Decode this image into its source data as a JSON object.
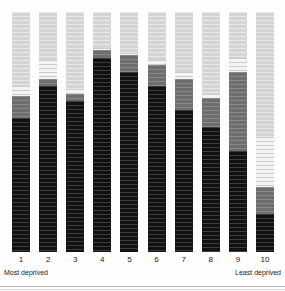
{
  "chart_data": {
    "type": "bar",
    "title": "",
    "subtitle": "",
    "xlabel": "",
    "ylabel": "",
    "stacked": true,
    "stack_mode": "percent",
    "grid": false,
    "legend_position": "none",
    "ylim": [
      0,
      100
    ],
    "categories": [
      "1",
      "2",
      "3",
      "4",
      "5",
      "6",
      "7",
      "8",
      "9",
      "10"
    ],
    "axis_annotations": {
      "left": "Most deprived",
      "right": "Least deprived"
    },
    "series": [
      {
        "name": "dark",
        "color": "#111111",
        "values": [
          56,
          69,
          63,
          81,
          75,
          69,
          59,
          52,
          42,
          16
        ]
      },
      {
        "name": "mid-gray",
        "color": "#6e6e6e",
        "values": [
          9,
          3,
          3,
          3,
          7,
          9,
          13,
          12,
          33,
          11
        ]
      },
      {
        "name": "white",
        "color": "#f4f4f4",
        "values": [
          4,
          8,
          2,
          1,
          1,
          2,
          3,
          2,
          6,
          21
        ]
      },
      {
        "name": "light-gray",
        "color": "#d4d4d4",
        "values": [
          31,
          20,
          32,
          15,
          17,
          20,
          25,
          34,
          19,
          52
        ]
      }
    ]
  },
  "bars": [
    {
      "label": "1",
      "dark": 56,
      "mid": 9,
      "white": 4,
      "light": 31
    },
    {
      "label": "2",
      "dark": 69,
      "mid": 3,
      "white": 8,
      "light": 20
    },
    {
      "label": "3",
      "dark": 63,
      "mid": 3,
      "white": 2,
      "light": 32
    },
    {
      "label": "4",
      "dark": 81,
      "mid": 3,
      "white": 1,
      "light": 15
    },
    {
      "label": "5",
      "dark": 75,
      "mid": 7,
      "white": 1,
      "light": 17
    },
    {
      "label": "6",
      "dark": 69,
      "mid": 9,
      "white": 2,
      "light": 20
    },
    {
      "label": "7",
      "dark": 59,
      "mid": 13,
      "white": 3,
      "light": 25
    },
    {
      "label": "8",
      "dark": 52,
      "mid": 12,
      "white": 2,
      "light": 34
    },
    {
      "label": "9",
      "dark": 42,
      "mid": 33,
      "white": 6,
      "light": 19
    },
    {
      "label": "10",
      "dark": 16,
      "mid": 11,
      "white": 21,
      "light": 52
    }
  ],
  "axis": {
    "ticks": [
      "1",
      "2",
      "3",
      "4",
      "5",
      "6",
      "7",
      "8",
      "9",
      "10"
    ],
    "left_annotation": "Most deprived",
    "right_annotation": "Least deprived"
  },
  "colors": {
    "dark": "#111111",
    "mid": "#6e6e6e",
    "white": "#f4f4f4",
    "light": "#d4d4d4",
    "background": "#fefefe",
    "text": "#1a1a1a"
  }
}
